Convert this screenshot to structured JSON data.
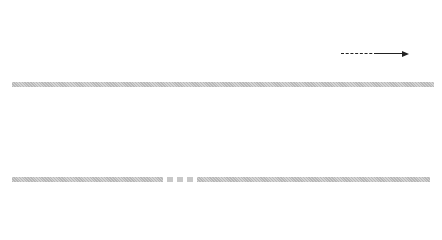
{
  "top_row": {
    "description": "Sequence of numbered positions along a bar; shaded discs are raised, outlined circles are lower",
    "markers": [
      {
        "label": "1",
        "style": "ring",
        "x": 23
      },
      {
        "label": "2",
        "style": "disc",
        "x": 46
      },
      {
        "label": "3",
        "style": "disc",
        "x": 69
      },
      {
        "label": "4",
        "style": "ring",
        "x": 92
      },
      {
        "label": "5",
        "style": "disc",
        "x": 115
      },
      {
        "label": "6",
        "style": "ring",
        "x": 139
      },
      {
        "label": "7",
        "style": "disc",
        "x": 162
      },
      {
        "label": "8",
        "style": "ring",
        "x": 185
      },
      {
        "label": "9",
        "style": "ring",
        "x": 208
      },
      {
        "label": "10",
        "style": "ring",
        "x": 231
      },
      {
        "label": "11",
        "style": "disc",
        "x": 255
      },
      {
        "label": "12",
        "style": "ring",
        "x": 278
      },
      {
        "label": "13",
        "style": "disc",
        "x": 302
      },
      {
        "label": "14",
        "style": "ring",
        "x": 326
      }
    ],
    "continuation_arrow": "dashed-then-solid right arrow"
  },
  "bottom_row": {
    "left_segment": {
      "markers": [
        {
          "label": "88",
          "style": "ring",
          "x": 23
        },
        {
          "label": "89",
          "style": "disc",
          "x": 37
        },
        {
          "label": "96",
          "style": "ring",
          "x": 134
        },
        {
          "label": "97",
          "style": "disc",
          "x": 149
        }
      ],
      "ticks_x": [
        51,
        65,
        79,
        93,
        107,
        121
      ]
    },
    "gap": "broken bar indicating omitted section",
    "right_segment": {
      "markers": [
        {
          "label": "112",
          "style": "ring",
          "x": 209
        },
        {
          "label": "113",
          "style": "disc",
          "x": 222
        },
        {
          "label": "126",
          "style": "ring",
          "x": 407
        },
        {
          "label": "127",
          "style": "disc",
          "x": 420
        }
      ],
      "ticks_x": [
        236,
        250,
        264,
        278,
        292,
        306,
        320,
        334,
        349,
        363,
        377,
        391
      ]
    }
  },
  "colors": {
    "disc_fill": "#e2e2e2",
    "ring_border": "#222222",
    "bar": "#c4c4c4",
    "stem": "#333333"
  }
}
